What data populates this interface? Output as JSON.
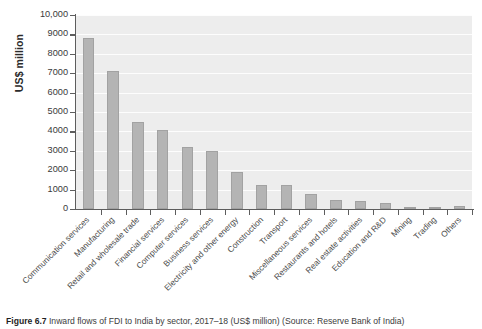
{
  "figure": {
    "caption_label": "Figure 6.7",
    "caption_text": "Inward flows of FDI to India by sector, 2017–18 (US$ million) (Source: Reserve Bank of India)"
  },
  "chart_data": {
    "type": "bar",
    "title": "",
    "xlabel": "",
    "ylabel": "US$ million",
    "ylim": [
      0,
      10000
    ],
    "grid": true,
    "legend": "none",
    "ytick_labels": [
      "0",
      "1000",
      "2000",
      "3000",
      "4000",
      "5000",
      "6000",
      "7000",
      "8000",
      "9000",
      "10,000"
    ],
    "ytick_values": [
      0,
      1000,
      2000,
      3000,
      4000,
      5000,
      6000,
      7000,
      8000,
      9000,
      10000
    ],
    "categories": [
      "Communication services",
      "Manufacturing",
      "Retail and wholesale trade",
      "Financial services",
      "Computer services",
      "Business services",
      "Electricity and other energy",
      "Construction",
      "Transport",
      "Miscellaneous services",
      "Restaurants and hotels",
      "Real estate activities",
      "Education and R&D",
      "Mining",
      "Trading",
      "Others"
    ],
    "values": [
      8800,
      7100,
      4500,
      4050,
      3200,
      3000,
      1900,
      1250,
      1250,
      750,
      450,
      400,
      330,
      60,
      20,
      160
    ],
    "bar_color": "#b4b4b4",
    "bar_edge_color": "#a2a2a2",
    "plot_background": "#ededed",
    "gridline_color": "#fdfdfd",
    "axis_color": "#5d5d5d"
  }
}
